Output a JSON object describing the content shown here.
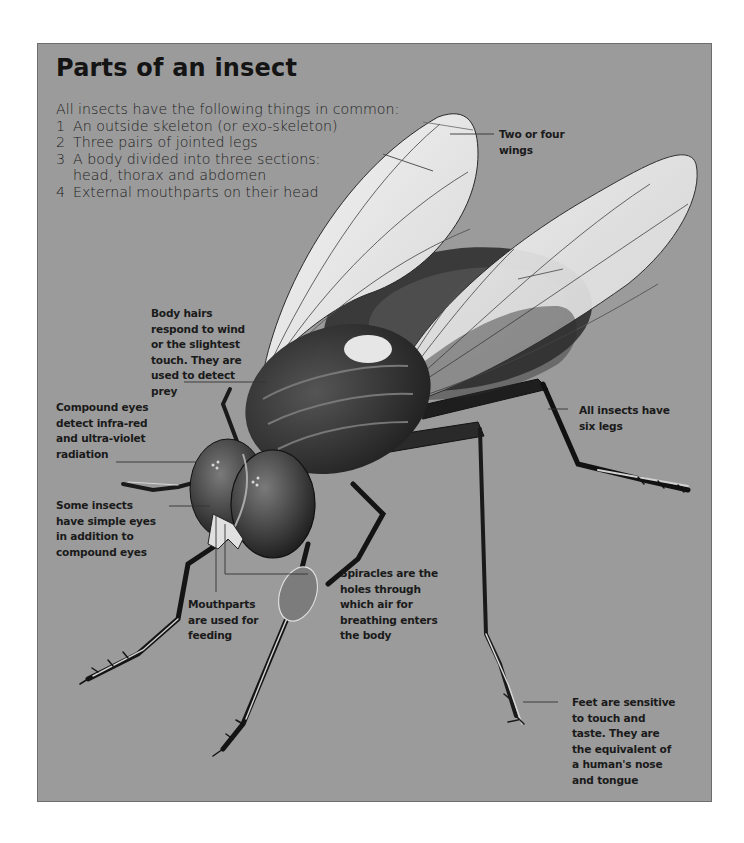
{
  "title": "Parts of an insect",
  "intro": {
    "lead": "All insects have the following things in common:",
    "items": [
      {
        "num": "1",
        "text": "An outside skeleton (or exo-skeleton)",
        "cont": ""
      },
      {
        "num": "2",
        "text": "Three pairs of jointed legs",
        "cont": ""
      },
      {
        "num": "3",
        "text": "A body divided into three sections:",
        "cont": "head, thorax and abdomen"
      },
      {
        "num": "4",
        "text": "External mouthparts on their head",
        "cont": ""
      }
    ]
  },
  "labels": {
    "wings": [
      "Two or four",
      "wings"
    ],
    "body_hairs": [
      "Body hairs",
      "respond to wind",
      "or the slightest",
      "touch. They are",
      "used to detect",
      "prey"
    ],
    "compound_eyes": [
      "Compound eyes",
      "detect infra-red",
      "and ultra-violet",
      "radiation"
    ],
    "simple_eyes": [
      "Some insects",
      "have simple eyes",
      "in addition to",
      "compound eyes"
    ],
    "mouthparts": [
      "Mouthparts",
      "are used for",
      "feeding"
    ],
    "spiracles": [
      "Spiracles are the",
      "holes through",
      "which air for",
      "breathing enters",
      "the body"
    ],
    "legs": [
      "All insects have",
      "six legs"
    ],
    "feet": [
      "Feet are sensitive",
      "to touch and",
      "taste. They are",
      "the equivalent of",
      "a human's nose",
      "and tongue"
    ]
  },
  "colors": {
    "background": "#9b9b9b",
    "text": "#1a1a1a",
    "wing": "#e8e8e8",
    "body": "#2e2e2e",
    "eye": "#4a4a4a"
  }
}
